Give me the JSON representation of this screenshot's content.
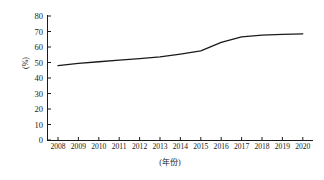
{
  "chart_data": {
    "type": "line",
    "title": "",
    "xlabel": "(年份)",
    "ylabel": "(%)",
    "categories": [
      "2008",
      "2009",
      "2010",
      "2011",
      "2012",
      "2013",
      "2014",
      "2015",
      "2016",
      "2017",
      "2018",
      "2019",
      "2020"
    ],
    "x": [
      2008,
      2009,
      2010,
      2011,
      2012,
      2013,
      2014,
      2015,
      2016,
      2017,
      2018,
      2019,
      2020
    ],
    "values": [
      48.0,
      49.4,
      50.5,
      51.5,
      52.5,
      53.6,
      55.4,
      57.5,
      63.0,
      66.5,
      67.6,
      68.1,
      68.5
    ],
    "series": [
      {
        "name": "",
        "values": [
          48.0,
          49.4,
          50.5,
          51.5,
          52.5,
          53.6,
          55.4,
          57.5,
          63.0,
          66.5,
          67.6,
          68.1,
          68.5
        ]
      }
    ],
    "yticks": [
      0,
      10,
      20,
      30,
      40,
      50,
      60,
      70,
      80
    ],
    "ytick_labels": [
      "0",
      "10",
      "20",
      "30",
      "40",
      "50",
      "60",
      "70",
      "80"
    ],
    "ylim": [
      0,
      80
    ],
    "xlim": [
      2008,
      2020
    ],
    "grid": false,
    "legend": false,
    "legend_position": "none",
    "line_color": "#1a1a1a",
    "line_width": 1.3,
    "markers": false,
    "spines": [
      "left",
      "bottom"
    ],
    "background_color": "#ffffff"
  }
}
